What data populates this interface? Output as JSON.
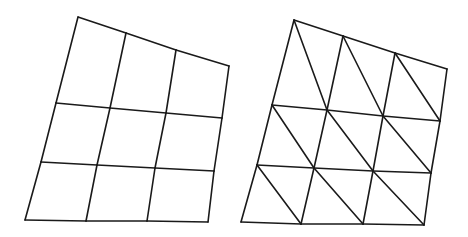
{
  "figure": {
    "stroke_color": "#1a1a1a",
    "background": "#ffffff"
  },
  "meshes": [
    {
      "name": "quad-mesh",
      "rows": [
        [
          [
            78,
            17
          ],
          [
            126,
            33
          ],
          [
            176,
            50
          ],
          [
            229,
            66
          ]
        ],
        [
          [
            56,
            103
          ],
          [
            110,
            108
          ],
          [
            166,
            113
          ],
          [
            222,
            118
          ]
        ],
        [
          [
            41,
            162
          ],
          [
            97,
            165
          ],
          [
            155,
            168
          ],
          [
            214,
            171
          ]
        ],
        [
          [
            25,
            220
          ],
          [
            86,
            221
          ],
          [
            147,
            221
          ],
          [
            208,
            222
          ]
        ]
      ],
      "diagonals": false
    },
    {
      "name": "triangulated-mesh",
      "rows": [
        [
          [
            294,
            20
          ],
          [
            343,
            36
          ],
          [
            395,
            53
          ],
          [
            447,
            69
          ]
        ],
        [
          [
            272,
            105
          ],
          [
            327,
            110
          ],
          [
            383,
            116
          ],
          [
            440,
            121
          ]
        ],
        [
          [
            257,
            165
          ],
          [
            314,
            168
          ],
          [
            373,
            171
          ],
          [
            431,
            173
          ]
        ],
        [
          [
            241,
            222
          ],
          [
            301,
            224
          ],
          [
            363,
            224
          ],
          [
            424,
            225
          ]
        ]
      ],
      "diagonals": true
    }
  ]
}
